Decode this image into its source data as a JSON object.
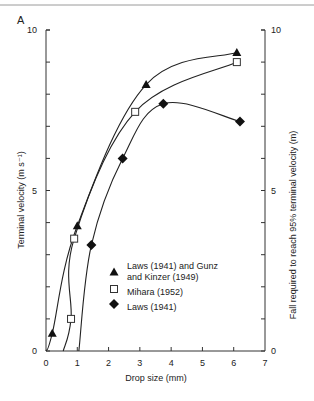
{
  "panel_label": "A",
  "chart_data": {
    "type": "line",
    "title": "",
    "panel": "A",
    "xlabel": "Drop size (mm)",
    "ylabel": "Terminal velocity (m s⁻¹)",
    "ylabel_right": "Fall required to reach 95% terminal velocity (m)",
    "xlim": [
      0,
      7
    ],
    "ylim": [
      0,
      10
    ],
    "ylim_right": [
      0,
      10
    ],
    "x_ticks": [
      0,
      1,
      2,
      3,
      4,
      5,
      6,
      7
    ],
    "y_tick_labels": [
      "0",
      "5",
      "10"
    ],
    "y_ticks_minor": [
      0,
      1,
      2,
      3,
      4,
      5,
      6,
      7,
      8,
      9,
      10
    ],
    "y_right_tick_labels": [
      "0",
      "5",
      "10"
    ],
    "grid": false,
    "legend_position": "inside-lower-middle",
    "series": [
      {
        "name": "Laws (1941) and Gunz and Kinzer (1949)",
        "legend_lines": [
          "Laws (1941) and Gunz",
          "and Kinzer (1949)"
        ],
        "marker": "triangle-filled",
        "axis": "left",
        "points": [
          [
            0.2,
            0.55
          ],
          [
            1.0,
            3.9
          ],
          [
            3.2,
            8.3
          ],
          [
            6.1,
            9.3
          ]
        ]
      },
      {
        "name": "Mihara (1952)",
        "legend_lines": [
          "Mihara (1952)"
        ],
        "marker": "square-open",
        "axis": "left",
        "points": [
          [
            0.8,
            1.0
          ],
          [
            0.9,
            3.5
          ],
          [
            2.85,
            7.45
          ],
          [
            6.1,
            9.0
          ]
        ]
      },
      {
        "name": "Laws (1941)",
        "legend_lines": [
          "Laws (1941)"
        ],
        "marker": "diamond-filled",
        "axis": "right",
        "points": [
          [
            1.45,
            3.3
          ],
          [
            2.45,
            6.0
          ],
          [
            3.75,
            7.7
          ],
          [
            6.2,
            7.15
          ]
        ]
      }
    ]
  },
  "colors": {
    "line": "#222222",
    "axis": "#333333",
    "rule": "#9a9a9a"
  }
}
